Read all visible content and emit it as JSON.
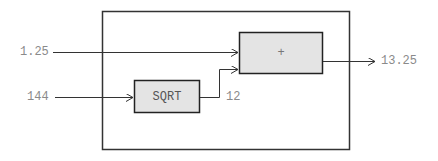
{
  "diagram": {
    "colors": {
      "line": "#222222",
      "block_fill": "#e4e4e4",
      "label_text": "#8a8a8a"
    },
    "inputs": [
      {
        "id": "in1",
        "label": "1.25"
      },
      {
        "id": "in2",
        "label": "144"
      }
    ],
    "blocks": [
      {
        "id": "sqrt",
        "label": "SQRT"
      },
      {
        "id": "sum",
        "label": "+"
      }
    ],
    "intermediate": {
      "sqrt_output": "12"
    },
    "output": {
      "label": "13.25"
    }
  }
}
